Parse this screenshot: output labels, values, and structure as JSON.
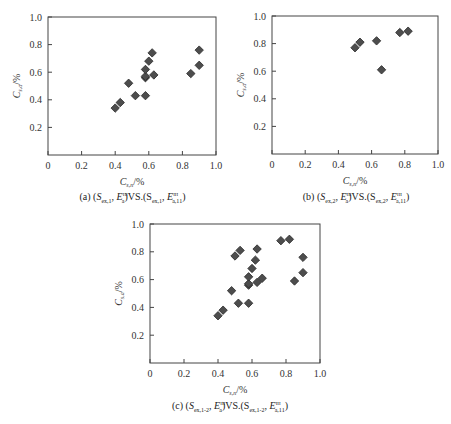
{
  "chart_data": [
    {
      "type": "scatter",
      "panel_id": "a",
      "caption": "(a) (S_ex,1, E_a^III) VS.(S_ex,1, E_a,11^III)",
      "xlabel": "C_s,n /%",
      "ylabel": "C_s,a /%",
      "xlim": [
        0,
        1.0
      ],
      "ylim": [
        0,
        1.0
      ],
      "xticks": [
        "0",
        "0.2",
        "0.4",
        "0.6",
        "0.8",
        "1.0"
      ],
      "yticks": [
        "0.2",
        "0.4",
        "0.6",
        "0.8",
        "1.0"
      ],
      "grid": false,
      "marker": "diamond",
      "marker_color": "#4d4d4d",
      "points": [
        [
          0.4,
          0.34
        ],
        [
          0.43,
          0.38
        ],
        [
          0.48,
          0.52
        ],
        [
          0.52,
          0.43
        ],
        [
          0.58,
          0.43
        ],
        [
          0.58,
          0.56
        ],
        [
          0.58,
          0.57
        ],
        [
          0.58,
          0.62
        ],
        [
          0.6,
          0.68
        ],
        [
          0.62,
          0.74
        ],
        [
          0.63,
          0.58
        ],
        [
          0.85,
          0.59
        ],
        [
          0.9,
          0.65
        ],
        [
          0.9,
          0.76
        ]
      ]
    },
    {
      "type": "scatter",
      "panel_id": "b",
      "caption": "(b) (S_ex,2, E_a^III) VS.(S_ex,2, E_a,11^III)",
      "xlabel": "C_s,n /%",
      "ylabel": "C_s,a /%",
      "xlim": [
        0,
        1.0
      ],
      "ylim": [
        0,
        1.0
      ],
      "xticks": [
        "0",
        "0.2",
        "0.4",
        "0.6",
        "0.8",
        "1.0"
      ],
      "yticks": [
        "0.2",
        "0.4",
        "0.6",
        "0.8",
        "1.0"
      ],
      "grid": false,
      "marker": "diamond",
      "marker_color": "#4d4d4d",
      "points": [
        [
          0.5,
          0.77
        ],
        [
          0.53,
          0.81
        ],
        [
          0.63,
          0.82
        ],
        [
          0.66,
          0.61
        ],
        [
          0.77,
          0.88
        ],
        [
          0.82,
          0.89
        ]
      ]
    },
    {
      "type": "scatter",
      "panel_id": "c",
      "caption": "(c) (S_ex,1-2, E_a^III) VS.(S_ex,1-2, E_a,11^III)",
      "xlabel": "C_s,n /%",
      "ylabel": "C_s,a /%",
      "xlim": [
        0,
        1.0
      ],
      "ylim": [
        0,
        1.0
      ],
      "xticks": [
        "0",
        "0.2",
        "0.4",
        "0.6",
        "0.8",
        "1.0"
      ],
      "yticks": [
        "0.2",
        "0.4",
        "0.6",
        "0.8",
        "1.0"
      ],
      "grid": false,
      "marker": "diamond",
      "marker_color": "#4d4d4d",
      "points": [
        [
          0.4,
          0.34
        ],
        [
          0.43,
          0.38
        ],
        [
          0.48,
          0.52
        ],
        [
          0.52,
          0.43
        ],
        [
          0.58,
          0.43
        ],
        [
          0.58,
          0.56
        ],
        [
          0.58,
          0.57
        ],
        [
          0.58,
          0.62
        ],
        [
          0.6,
          0.68
        ],
        [
          0.62,
          0.74
        ],
        [
          0.63,
          0.58
        ],
        [
          0.85,
          0.59
        ],
        [
          0.9,
          0.65
        ],
        [
          0.9,
          0.76
        ],
        [
          0.5,
          0.77
        ],
        [
          0.53,
          0.81
        ],
        [
          0.63,
          0.82
        ],
        [
          0.66,
          0.61
        ],
        [
          0.77,
          0.88
        ],
        [
          0.82,
          0.89
        ]
      ]
    }
  ],
  "panels": {
    "a": {
      "caption_prefix": "(a) (",
      "caption_s1": "S",
      "caption_s1_sub": "ex,1",
      "caption_e1": "E",
      "caption_e1_sup": "III",
      "caption_e1_sub": "a",
      "caption_mid": ")VS.(S",
      "caption_s2_sub": "ex,1",
      "caption_e2": "E",
      "caption_e2_sup": "III",
      "caption_e2_sub": "a,11",
      "caption_end": ")"
    },
    "b": {
      "caption_prefix": "(b) (",
      "caption_s1": "S",
      "caption_s1_sub": "ex,2",
      "caption_e1": "E",
      "caption_e1_sup": "III",
      "caption_e1_sub": "a",
      "caption_mid": ")VS.(S",
      "caption_s2_sub": "ex,2",
      "caption_e2": "E",
      "caption_e2_sup": "III",
      "caption_e2_sub": "a,11",
      "caption_end": ")"
    },
    "c": {
      "caption_prefix": "(c) (",
      "caption_s1": "S",
      "caption_s1_sub": "ex,1-2",
      "caption_e1": "E",
      "caption_e1_sup": "III",
      "caption_e1_sub": "a",
      "caption_mid": ")VS.(S",
      "caption_s2_sub": "ex,1-2",
      "caption_e2": "E",
      "caption_e2_sup": "III",
      "caption_e2_sub": "a,11",
      "caption_end": ")"
    }
  },
  "axis_labels": {
    "x_main": "C",
    "x_sub": "s,n",
    "x_unit": "/%",
    "y_main": "C",
    "y_sub": "s,a",
    "y_unit": "/%"
  }
}
